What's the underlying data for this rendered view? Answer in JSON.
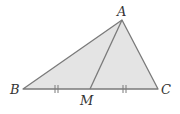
{
  "diagram": {
    "type": "triangle-with-median",
    "colors": {
      "fill": "#e4e4e4",
      "stroke": "#7a7a7a",
      "label": "#333333"
    },
    "points": {
      "A": {
        "label": "A",
        "x": 122,
        "y": 20
      },
      "B": {
        "label": "B",
        "x": 23,
        "y": 89
      },
      "C": {
        "label": "C",
        "x": 158,
        "y": 89
      },
      "M": {
        "label": "M",
        "x": 90,
        "y": 89
      }
    },
    "segments": [
      "AB",
      "AC",
      "BC",
      "AM"
    ],
    "equal_marks": [
      {
        "segment": "BM",
        "ticks": 2
      },
      {
        "segment": "MC",
        "ticks": 2
      }
    ]
  }
}
